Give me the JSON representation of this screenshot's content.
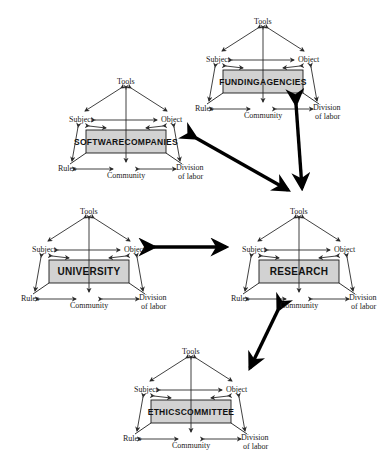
{
  "diagram": {
    "background": "#ffffff",
    "node_fill": "#d2d2d2",
    "node_stroke": "#1a1a1a",
    "thin_stroke": "#2b2b2b",
    "thick_stroke": "#000000",
    "vertex_labels": {
      "tools": "Tools",
      "subject": "Subject",
      "object": "Object",
      "rules": "Rules",
      "community": "Community",
      "division_line1": "Division",
      "division_line2": "of labor"
    },
    "nodes": [
      {
        "id": "software-companies",
        "label": "SOFTWARE COMPANIES",
        "lines": [
          "SOFTWARE",
          "COMPANIES"
        ],
        "x": 55,
        "y": 68
      },
      {
        "id": "funding-agencies",
        "label": "FUNDING AGENCIES",
        "lines": [
          "FUNDING",
          "AGENCIES"
        ],
        "x": 192,
        "y": 8
      },
      {
        "id": "university",
        "label": "UNIVERSITY",
        "lines": [
          "UNIVERSITY"
        ],
        "x": 18,
        "y": 198
      },
      {
        "id": "research",
        "label": "RESEARCH",
        "lines": [
          "RESEARCH"
        ],
        "x": 228,
        "y": 198
      },
      {
        "id": "ethics-committee",
        "label": "ETHICS COMMITTEE",
        "lines": [
          "ETHICS",
          "COMMITTEE"
        ],
        "x": 120,
        "y": 338
      }
    ],
    "connectors": [
      {
        "id": "software-research",
        "from": "software-companies",
        "to": "research",
        "style": "double-headed-thick"
      },
      {
        "id": "funding-research",
        "from": "funding-agencies",
        "to": "research",
        "style": "double-headed-thick"
      },
      {
        "id": "university-research",
        "from": "university",
        "to": "research",
        "style": "double-headed-thick"
      },
      {
        "id": "research-ethics",
        "from": "research",
        "to": "ethics-committee",
        "style": "double-headed-thick"
      }
    ]
  }
}
